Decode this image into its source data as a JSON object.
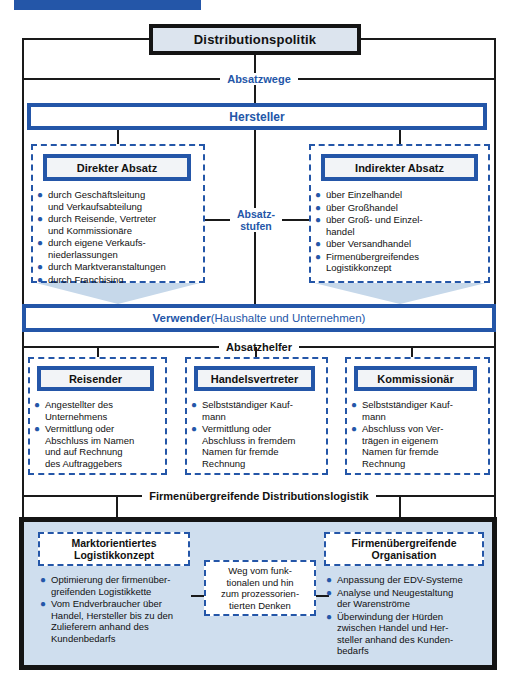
{
  "colors": {
    "accent_blue": "#2456a8",
    "light_fill": "#dce4ee",
    "bottom_fill": "#cfdeee",
    "arrow_fill": "#c6d8ea",
    "line_black": "#1a1a1a"
  },
  "header_bar": {
    "note": "clipped-blue-banner"
  },
  "root": {
    "title": "Distributionspolitik"
  },
  "levels": {
    "absatzwege": "Absatzwege",
    "hersteller": "Hersteller",
    "absatzstufen": "Absatz-\nstufen",
    "verwender_bold": "Verwender",
    "verwender_rest": " (Haushalte und Unternehmen)",
    "absatzhelfer": "Absatzhelfer",
    "distributionslogistik": "Firmenübergreifende Distributionslogistik"
  },
  "direkter_absatz": {
    "title": "Direkter Absatz",
    "items": [
      "durch Geschäftsleitung\nund Verkaufsabteilung",
      "durch Reisende, Vertreter\nund Kommissionäre",
      "durch eigene Verkaufs-\nniederlassungen",
      "durch Marktveranstaltungen",
      "durch Franchising"
    ]
  },
  "indirekter_absatz": {
    "title": "Indirekter Absatz",
    "items": [
      "über Einzelhandel",
      "über Großhandel",
      "über Groß- und Einzel-\nhandel",
      "über Versandhandel",
      "Firmenübergreifendes\nLogistikkonzept"
    ]
  },
  "helpers": [
    {
      "title": "Reisender",
      "items": [
        "Angestellter des\nUnternehmens",
        "Vermittlung oder\nAbschluss im Namen\nund auf Rechnung\ndes Auftraggebers"
      ]
    },
    {
      "title": "Handelsvertreter",
      "items": [
        "Selbstständiger Kauf-\nmann",
        "Vermittlung oder\nAbschluss in fremdem\nNamen für fremde\nRechnung"
      ]
    },
    {
      "title": "Kommissionär",
      "items": [
        "Selbstständiger Kauf-\nmann",
        "Abschluss von Ver-\nträgen in eigenem\nNamen für fremde\nRechnung"
      ]
    }
  ],
  "bottom": {
    "left": {
      "title": "Marktorientiertes\nLogistikkonzept",
      "items": [
        "Optimierung der firmenüber-\ngreifenden Logistikkette",
        "Vom Endverbraucher über\nHandel, Hersteller bis zu den\nZulieferern anhand des\nKundenbedarfs"
      ]
    },
    "center_note": "Weg vom funk-\ntionalen und hin\nzum prozessorien-\ntierten Denken",
    "right": {
      "title": "Firmenübergreifende\nOrganisation",
      "items": [
        "Anpassung der EDV-Systeme",
        "Analyse und Neugestaltung\nder Warenströme",
        "Überwindung der Hürden\nzwischen Handel und Her-\nsteller anhand des Kunden-\nbedarfs"
      ]
    }
  }
}
